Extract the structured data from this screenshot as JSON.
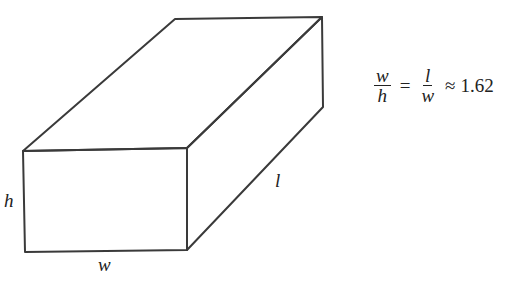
{
  "diagram": {
    "labels": {
      "height": "h",
      "width": "w",
      "length": "l"
    },
    "formula": {
      "frac1": {
        "numerator": "w",
        "denominator": "h"
      },
      "equals": "=",
      "frac2": {
        "numerator": "l",
        "denominator": "w"
      },
      "approx": "≈",
      "value": "1.62"
    },
    "stroke_color": "#3a3a3a"
  }
}
